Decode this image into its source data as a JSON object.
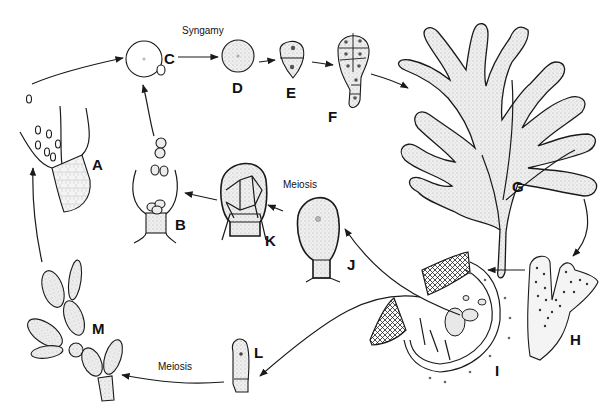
{
  "diagram": {
    "colors": {
      "ink": "#1a1a1a",
      "background": "#ffffff",
      "stipple": "#d9d9d9"
    },
    "annotations": {
      "syngamy": "Syngamy",
      "meiosis_top": "Meiosis",
      "meiosis_bottom": "Meiosis"
    },
    "stages": [
      {
        "id": "A",
        "label": "A",
        "description": "spermatangia releasing spermatia from filament tip"
      },
      {
        "id": "B",
        "label": "B",
        "description": "sporangium releasing spores"
      },
      {
        "id": "C",
        "label": "C",
        "description": "egg with attached spermatium (syngamy)"
      },
      {
        "id": "D",
        "label": "D",
        "description": "zygote"
      },
      {
        "id": "E",
        "label": "E",
        "description": "two-celled stage"
      },
      {
        "id": "F",
        "label": "F",
        "description": "multicellular germling"
      },
      {
        "id": "G",
        "label": "G",
        "description": "branched thallus"
      },
      {
        "id": "H",
        "label": "H",
        "description": "thallus tip with scattered reproductive structures"
      },
      {
        "id": "I",
        "label": "I",
        "description": "section through reproductive conceptacle"
      },
      {
        "id": "J",
        "label": "J",
        "description": "undivided sporangium on stalk cell"
      },
      {
        "id": "K",
        "label": "K",
        "description": "sporangium divided into spores after meiosis"
      },
      {
        "id": "L",
        "label": "L",
        "description": "single-celled structure on filament"
      },
      {
        "id": "M",
        "label": "M",
        "description": "branched filament with sporangia"
      }
    ],
    "flow": [
      [
        "A",
        "C"
      ],
      [
        "B",
        "C"
      ],
      [
        "C",
        "D"
      ],
      [
        "D",
        "E"
      ],
      [
        "E",
        "F"
      ],
      [
        "F",
        "G"
      ],
      [
        "G",
        "H"
      ],
      [
        "H",
        "I"
      ],
      [
        "I",
        "J"
      ],
      [
        "J",
        "K"
      ],
      [
        "K",
        "B"
      ],
      [
        "I",
        "L"
      ],
      [
        "L",
        "M"
      ],
      [
        "M",
        "A"
      ]
    ]
  }
}
